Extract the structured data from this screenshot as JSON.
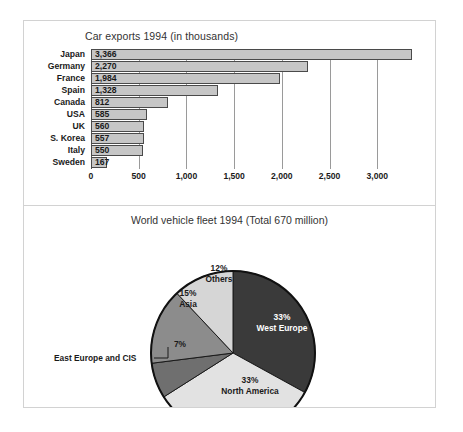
{
  "figure": {
    "bar_chart": {
      "title": "Car exports 1994 (in thousands)"
    },
    "pie_chart": {
      "title": "World vehicle fleet 1994 (Total 670 million)",
      "callout": "East Europe and CIS"
    }
  },
  "chart_data": [
    {
      "type": "bar",
      "orientation": "horizontal",
      "title": "Car exports 1994 (in thousands)",
      "xlabel": "",
      "ylabel": "",
      "xlim": [
        0,
        3500
      ],
      "grid": true,
      "grid_axis": "x",
      "tick_labels": [
        "0",
        "500",
        "1,000",
        "1,500",
        "2,000",
        "2,500",
        "3,000"
      ],
      "ticks": [
        0,
        500,
        1000,
        1500,
        2000,
        2500,
        3000
      ],
      "categories": [
        "Japan",
        "Germany",
        "France",
        "Spain",
        "Canada",
        "USA",
        "UK",
        "S. Korea",
        "Italy",
        "Sweden"
      ],
      "values": [
        3366,
        2270,
        1984,
        1328,
        812,
        585,
        560,
        557,
        550,
        167
      ],
      "value_labels": [
        "3,366",
        "2,270",
        "1,984",
        "1,328",
        "812",
        "585",
        "560",
        "557",
        "550",
        "167"
      ],
      "bar_color": "#c6c6c6",
      "bar_border_color": "#4a4a4a"
    },
    {
      "type": "pie",
      "title": "World vehicle fleet 1994 (Total 670 million)",
      "total_label": "Total 670 million",
      "legend": "none",
      "start_angle_deg": 0,
      "direction": "clockwise",
      "slices": [
        {
          "label": "West Europe",
          "percent": 33,
          "percent_label": "33%",
          "color": "#3a3a3a",
          "text_color": "#ffffff",
          "label_x": 282,
          "label_y": 322
        },
        {
          "label": "North America",
          "percent": 33,
          "percent_label": "33%",
          "color": "#e2e2e2",
          "text_color": "#1a1a1a",
          "label_x": 250,
          "label_y": 385
        },
        {
          "label": "East Europe and CIS",
          "percent": 7,
          "percent_label": "7%",
          "color": "#6f6f6f",
          "text_color": "#1a1a1a",
          "label_x": 180,
          "label_y": 344,
          "callout": true
        },
        {
          "label": "Asia",
          "percent": 15,
          "percent_label": "15%",
          "color": "#8c8c8c",
          "text_color": "#1a1a1a",
          "label_x": 188,
          "label_y": 298
        },
        {
          "label": "Others",
          "percent": 12,
          "percent_label": "12%",
          "color": "#d6d6d6",
          "text_color": "#1a1a1a",
          "label_x": 219,
          "label_y": 273
        }
      ]
    }
  ]
}
